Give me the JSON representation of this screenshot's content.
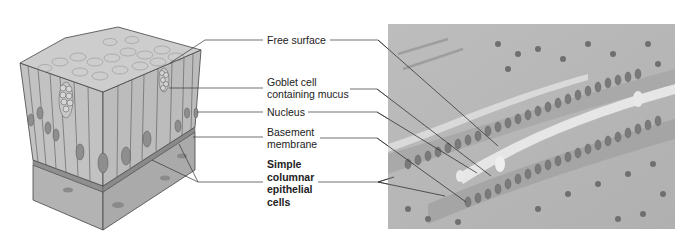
{
  "figure": {
    "labels": [
      {
        "id": "free-surface",
        "text": "Free surface"
      },
      {
        "id": "goblet-cell",
        "text": "Goblet cell\ncontaining mucus",
        "line1": "Goblet cell",
        "line2": "containing mucus"
      },
      {
        "id": "nucleus",
        "text": "Nucleus"
      },
      {
        "id": "basement-membrane",
        "line1": "Basement",
        "line2": "membrane"
      },
      {
        "id": "simple-columnar",
        "line1": "Simple",
        "line2": "columnar",
        "line3": "epithelial",
        "line4": "cells"
      }
    ],
    "colors": {
      "cell_fill": "#bdbdbd",
      "surface_fill": "#c9c9c9",
      "nucleus_fill": "#8e8e8e",
      "connective_fill": "#b0b0b0",
      "line": "#333333",
      "photo_bg": "#b9b9b9"
    }
  }
}
